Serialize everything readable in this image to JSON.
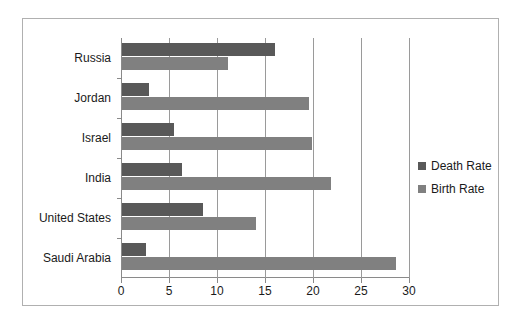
{
  "chart_data": {
    "type": "bar",
    "orientation": "horizontal",
    "title": "",
    "xlabel": "",
    "ylabel": "",
    "categories": [
      "Russia",
      "Jordan",
      "Israel",
      "India",
      "United States",
      "Saudi Arabia"
    ],
    "series": [
      {
        "name": "Death Rate",
        "color": "#595959",
        "values": [
          15.9,
          2.8,
          5.4,
          6.3,
          8.4,
          2.5
        ]
      },
      {
        "name": "Birth Rate",
        "color": "#808080",
        "values": [
          11.0,
          19.5,
          19.8,
          21.8,
          14.0,
          28.5
        ]
      }
    ],
    "xlim": [
      0,
      30
    ],
    "xticks": [
      0,
      5,
      10,
      15,
      20,
      25,
      30
    ],
    "xtick_labels": [
      "0",
      "5",
      "10",
      "15",
      "20",
      "25",
      "30"
    ],
    "grid": "vertical",
    "legend_position": "right"
  },
  "legend": {
    "entries": [
      {
        "label": "Death Rate",
        "color": "#595959"
      },
      {
        "label": "Birth Rate",
        "color": "#808080"
      }
    ]
  },
  "colors": {
    "death_rate": "#595959",
    "birth_rate": "#808080",
    "gridline": "#9a9a9a",
    "axis": "#8a8a8a",
    "frame_border": "#b0b0b0",
    "text": "#1a1a1a",
    "background": "#ffffff"
  }
}
